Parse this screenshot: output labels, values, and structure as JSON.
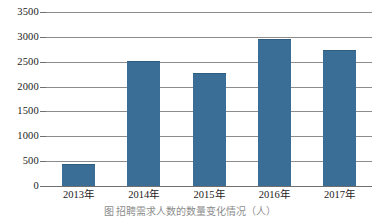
{
  "chart_data": {
    "type": "bar",
    "title": "",
    "xlabel": "",
    "ylabel": "",
    "categories": [
      "2013年",
      "2014年",
      "2015年",
      "2016年",
      "2017年"
    ],
    "values": [
      450,
      2510,
      2270,
      2950,
      2740
    ],
    "series": [
      {
        "name": "",
        "values": [
          450,
          2510,
          2270,
          2950,
          2740
        ]
      }
    ],
    "ylim": [
      0,
      3500
    ],
    "yticks": [
      0,
      500,
      1000,
      1500,
      2000,
      2500,
      3000,
      3500
    ],
    "ytick_labels": [
      "0",
      "500",
      "1000",
      "1500",
      "2000",
      "2500",
      "3000",
      "3500"
    ],
    "grid": true,
    "legend": false,
    "legend_position": "none",
    "bar_color": "#3a6e96",
    "gridline_color": "#8c8c8c",
    "axis_color": "#6f6f6f",
    "background_color": "#ffffff"
  },
  "caption": {
    "text": "图  招聘需求人数的数量变化情况（人）",
    "clipped": true
  }
}
